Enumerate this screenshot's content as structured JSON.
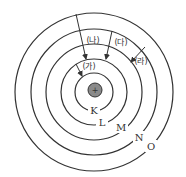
{
  "diagram": {
    "nucleus": {
      "symbol": "+",
      "fill": "#8a8a8a"
    },
    "shells": [
      {
        "label": "K",
        "r": 19
      },
      {
        "label": "L",
        "r": 33
      },
      {
        "label": "M",
        "r": 48
      },
      {
        "label": "N",
        "r": 63
      },
      {
        "label": "O",
        "r": 79
      }
    ],
    "transitions": [
      {
        "label": "(가)",
        "from": "L",
        "to": "K"
      },
      {
        "label": "(나)",
        "from": "O",
        "to": "M"
      },
      {
        "label": "(다)",
        "from": "N",
        "to": "M"
      },
      {
        "label": "(라)",
        "from": "N",
        "to": "M"
      }
    ]
  }
}
